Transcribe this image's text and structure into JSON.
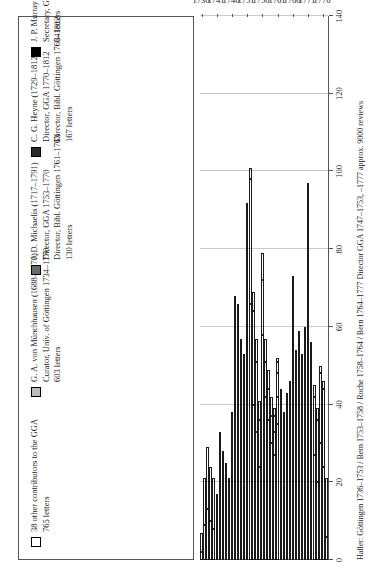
{
  "legend": {
    "items": [
      {
        "swatch": "white",
        "swatch_name": "legend-swatch-other-contributors",
        "line1": "38 other contributors to the GGA",
        "line2": "765 letters",
        "line3": "",
        "line4": ""
      },
      {
        "swatch": "ltgray",
        "swatch_name": "legend-swatch-munchhausen",
        "line1": "G. A. von Münchhausen (1688–1770)",
        "line2": "Curator, Univ. of Göttingen 1734–1770",
        "line3": "603 letters",
        "line4": ""
      },
      {
        "swatch": "dkgray",
        "swatch_name": "legend-swatch-michaelis",
        "line1": "J. D. Michaelis (1717–1791)",
        "line2": "Director, GGA 1753–1770",
        "line3": "Director, Bibl. Göttingen 1761–1763",
        "line4": "130 letters"
      },
      {
        "swatch": "vdark",
        "swatch_name": "legend-swatch-heyne",
        "line1": "C. G. Heyne (1729–1812)",
        "line2": "Director, GGA 1770–1812",
        "line3": "Director, Bibl. Göttingen 1763–1812",
        "line4": "167 letters"
      },
      {
        "swatch": "black",
        "swatch_name": "legend-swatch-murray",
        "line1": "J. P. Murray (1726–1776)",
        "line2": "Secretary, GdW Göttingen 1762–1770",
        "line3": "64 letters",
        "line4": ""
      }
    ]
  },
  "caption": "Haller: Göttingen 1736–1753 / Bern 1753–1758 / Roche 1758–1764 / Bern 1764–1777   Director GGA 1747–1753, –1777   approx. 9000 reviews",
  "chart_data": {
    "type": "bar",
    "orientation": "horizontal",
    "stacked": true,
    "title": "",
    "xlabel": "",
    "ylabel": "",
    "xlim": [
      0,
      140
    ],
    "xticks": [
      0,
      20,
      40,
      60,
      80,
      100,
      120,
      140
    ],
    "grid": true,
    "legend_position": "top",
    "year_ticks": [
      1736,
      1741,
      1746,
      1751,
      1756,
      1761,
      1766,
      1771,
      1776
    ],
    "colors": {
      "other": "#ffffff",
      "munchhausen": "#bdbdbd",
      "michaelis": "#6b6b6b",
      "heyne": "#2b2b2b",
      "murray": "#000000"
    },
    "categories": [
      1736,
      1737,
      1738,
      1739,
      1740,
      1741,
      1742,
      1743,
      1744,
      1745,
      1746,
      1747,
      1748,
      1749,
      1750,
      1751,
      1752,
      1753,
      1754,
      1755,
      1756,
      1757,
      1758,
      1759,
      1760,
      1761,
      1762,
      1763,
      1764,
      1765,
      1766,
      1767,
      1768,
      1769,
      1770,
      1771,
      1772,
      1773,
      1774,
      1775,
      1776,
      1777
    ],
    "series": [
      {
        "name": "38 other contributors to the GGA",
        "key": "other",
        "total": 765,
        "values": [
          2,
          9,
          13,
          10,
          8,
          6,
          15,
          11,
          9,
          7,
          15,
          38,
          35,
          30,
          28,
          60,
          66,
          40,
          33,
          24,
          58,
          42,
          36,
          30,
          27,
          35,
          28,
          22,
          24,
          26,
          46,
          30,
          32,
          28,
          30,
          62,
          38,
          27,
          20,
          30,
          24,
          6
        ]
      },
      {
        "name": "G. A. von Münchhausen (1688–1770)",
        "key": "munchhausen",
        "total": 603,
        "values": [
          5,
          12,
          16,
          14,
          13,
          11,
          18,
          17,
          16,
          14,
          23,
          30,
          31,
          27,
          25,
          30,
          32,
          24,
          18,
          12,
          14,
          9,
          8,
          7,
          6,
          7,
          6,
          5,
          6,
          6,
          9,
          7,
          8,
          7,
          8,
          10,
          0,
          0,
          0,
          0,
          0,
          0
        ]
      },
      {
        "name": "J. D. Michaelis (1717–1791)",
        "key": "michaelis",
        "total": 130,
        "values": [
          0,
          0,
          0,
          0,
          0,
          0,
          0,
          0,
          0,
          0,
          0,
          0,
          0,
          0,
          0,
          2,
          3,
          5,
          6,
          5,
          7,
          6,
          5,
          5,
          4,
          6,
          5,
          4,
          5,
          5,
          7,
          6,
          6,
          5,
          6,
          5,
          0,
          0,
          0,
          0,
          0,
          0
        ]
      },
      {
        "name": "C. G. Heyne (1729–1812)",
        "key": "heyne",
        "total": 167,
        "values": [
          0,
          0,
          0,
          0,
          0,
          0,
          0,
          0,
          0,
          0,
          0,
          0,
          0,
          0,
          0,
          0,
          0,
          0,
          0,
          0,
          0,
          0,
          0,
          0,
          2,
          3,
          3,
          4,
          5,
          5,
          6,
          6,
          7,
          7,
          9,
          12,
          14,
          15,
          16,
          18,
          20,
          15
        ]
      },
      {
        "name": "J. P. Murray (1726–1776)",
        "key": "murray",
        "total": 64,
        "values": [
          0,
          0,
          0,
          0,
          0,
          0,
          0,
          0,
          0,
          0,
          0,
          0,
          0,
          0,
          0,
          0,
          0,
          0,
          0,
          0,
          0,
          0,
          0,
          0,
          0,
          1,
          2,
          3,
          3,
          4,
          5,
          5,
          6,
          6,
          7,
          8,
          4,
          3,
          3,
          2,
          2,
          0
        ]
      }
    ]
  }
}
